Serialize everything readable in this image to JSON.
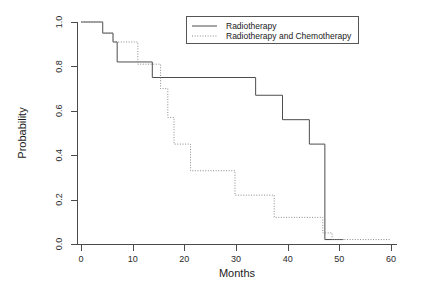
{
  "chart_data": {
    "type": "line",
    "title": "",
    "subtitle": "",
    "xlabel": "Months",
    "ylabel": "Probability",
    "xlim": [
      -2,
      62
    ],
    "ylim": [
      0.0,
      1.0
    ],
    "grid": false,
    "legend_position": "top-right",
    "xticks": [
      0,
      10,
      20,
      30,
      40,
      50,
      60
    ],
    "xticklabels": [
      "0",
      "10",
      "20",
      "30",
      "40",
      "50",
      "60"
    ],
    "yticks": [
      0.0,
      0.2,
      0.4,
      0.6,
      0.8,
      1.0
    ],
    "yticklabels": [
      "0.0",
      "0.2",
      "0.4",
      "0.6",
      "0.8",
      "1.0"
    ],
    "series": [
      {
        "name": "Radiotherapy",
        "style": "solid",
        "color": "#4d4d4d",
        "steps": [
          [
            0.0,
            1.0
          ],
          [
            4.2,
            0.95
          ],
          [
            6.2,
            0.91
          ],
          [
            7.0,
            0.82
          ],
          [
            13.8,
            0.75
          ],
          [
            33.8,
            0.67
          ],
          [
            39.0,
            0.56
          ],
          [
            44.2,
            0.45
          ],
          [
            47.2,
            0.02
          ],
          [
            50.8,
            0.02
          ]
        ]
      },
      {
        "name": "Radiotherapy and Chemotherapy",
        "style": "dotted",
        "color": "#8a8a8a",
        "steps": [
          [
            0.0,
            1.0
          ],
          [
            4.2,
            0.95
          ],
          [
            6.2,
            0.91
          ],
          [
            11.0,
            0.81
          ],
          [
            15.4,
            0.7
          ],
          [
            16.8,
            0.57
          ],
          [
            18.0,
            0.45
          ],
          [
            21.2,
            0.33
          ],
          [
            29.8,
            0.22
          ],
          [
            37.4,
            0.12
          ],
          [
            46.8,
            0.05
          ],
          [
            48.6,
            0.02
          ],
          [
            60.0,
            0.02
          ]
        ]
      }
    ]
  },
  "legend": {
    "entries": [
      {
        "label": "Radiotherapy",
        "style": "solid"
      },
      {
        "label": "Radiotherapy and Chemotherapy",
        "style": "dotted"
      }
    ]
  }
}
